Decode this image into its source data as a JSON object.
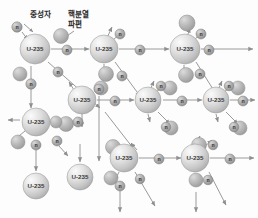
{
  "figure": {
    "background_color": "#fdfdfd",
    "width": 258,
    "height": 218
  },
  "labels": [
    {
      "id": "neutron-label",
      "text": "중성자",
      "x": 30,
      "y": 10
    },
    {
      "id": "fragment-label-1",
      "text": "핵분열",
      "x": 68,
      "y": 10
    },
    {
      "id": "fragment-label-2",
      "text": "파편",
      "x": 68,
      "y": 20
    }
  ],
  "legend_leaders": [
    {
      "id": "neutron-leader",
      "x1": 24,
      "y1": 24,
      "x2": 33,
      "y2": 32
    },
    {
      "id": "fragment-leader",
      "x1": 74,
      "y1": 31,
      "x2": 64,
      "y2": 38
    }
  ],
  "colors": {
    "nucleus_fill": "#d8d8d8",
    "nucleus_highlight": "#f4f4f4",
    "nucleus_edge": "#9a9a9a",
    "nucleus_text": "#3a3a3a",
    "neutron_fill": "#a9a9a9",
    "neutron_highlight": "#cfcfcf",
    "neutron_edge": "#7a7a7a",
    "neutron_text": "#2a2a2a",
    "fragment_fill": "#b4b4b4",
    "fragment_highlight": "#d6d6d6",
    "fragment_edge": "#8c8c8c",
    "arrow": "#8f8f8f",
    "label_text": "#2b2b2b"
  },
  "nucleus_label": "U-235",
  "neutron_label": "n",
  "nuclei": [
    {
      "id": "u1",
      "label": "U-235",
      "x": 35,
      "y": 49,
      "r": 15
    },
    {
      "id": "u2",
      "label": "U-235",
      "x": 104,
      "y": 49,
      "r": 14
    },
    {
      "id": "u3",
      "label": "U-235",
      "x": 185,
      "y": 49,
      "r": 15
    },
    {
      "id": "u4",
      "label": "U-235",
      "x": 82,
      "y": 100,
      "r": 14
    },
    {
      "id": "u5",
      "label": "U-235",
      "x": 148,
      "y": 100,
      "r": 13
    },
    {
      "id": "u6",
      "label": "U-235",
      "x": 216,
      "y": 100,
      "r": 13
    },
    {
      "id": "u7",
      "label": "U-235",
      "x": 36,
      "y": 122,
      "r": 14
    },
    {
      "id": "u8",
      "label": "U-235",
      "x": 36,
      "y": 186,
      "r": 13
    },
    {
      "id": "u9",
      "label": "U-235",
      "x": 80,
      "y": 177,
      "r": 13
    },
    {
      "id": "u10",
      "label": "U-235",
      "x": 124,
      "y": 158,
      "r": 14
    },
    {
      "id": "u11",
      "label": "U-235",
      "x": 195,
      "y": 158,
      "r": 14
    }
  ],
  "neutrons": [
    {
      "id": "n-in-1",
      "label": "n",
      "x": 17,
      "y": 27,
      "r": 5.2
    },
    {
      "id": "n-a1",
      "label": "n",
      "x": 67,
      "y": 50,
      "r": 5.0
    },
    {
      "id": "n-a2",
      "label": "n",
      "x": 140,
      "y": 50,
      "r": 5.0
    },
    {
      "id": "n-a3",
      "label": "n",
      "x": 209,
      "y": 50,
      "r": 5.0
    },
    {
      "id": "n-b1",
      "label": "n",
      "x": 31,
      "y": 84,
      "r": 5.2
    },
    {
      "id": "n-b2",
      "label": "n",
      "x": 58,
      "y": 72,
      "r": 5.0
    },
    {
      "id": "n-b3",
      "label": "n",
      "x": 120,
      "y": 34,
      "r": 5.0
    },
    {
      "id": "n-b4",
      "label": "n",
      "x": 122,
      "y": 76,
      "r": 5.0
    },
    {
      "id": "n-b5",
      "label": "n",
      "x": 201,
      "y": 34,
      "r": 5.0
    },
    {
      "id": "n-b6",
      "label": "n",
      "x": 200,
      "y": 74,
      "r": 5.0
    },
    {
      "id": "n-c1",
      "label": "n",
      "x": 115,
      "y": 101,
      "r": 5.0
    },
    {
      "id": "n-c2",
      "label": "n",
      "x": 182,
      "y": 101,
      "r": 5.0
    },
    {
      "id": "n-c3",
      "label": "n",
      "x": 243,
      "y": 101,
      "r": 5.0
    },
    {
      "id": "n-d1",
      "label": "n",
      "x": 161,
      "y": 86,
      "r": 4.8
    },
    {
      "id": "n-d2",
      "label": "n",
      "x": 229,
      "y": 86,
      "r": 4.8
    },
    {
      "id": "n-d3",
      "label": "n",
      "x": 166,
      "y": 127,
      "r": 4.8
    },
    {
      "id": "n-d4",
      "label": "n",
      "x": 234,
      "y": 127,
      "r": 4.8
    },
    {
      "id": "n-e1",
      "label": "n",
      "x": 78,
      "y": 122,
      "r": 5.0
    },
    {
      "id": "n-e2",
      "label": "n",
      "x": 57,
      "y": 141,
      "r": 5.0
    },
    {
      "id": "n-e3",
      "label": "n",
      "x": 36,
      "y": 145,
      "r": 5.0
    },
    {
      "id": "n-f1",
      "label": "n",
      "x": 159,
      "y": 159,
      "r": 5.0
    },
    {
      "id": "n-f2",
      "label": "n",
      "x": 230,
      "y": 159,
      "r": 5.0
    },
    {
      "id": "n-f3",
      "label": "n",
      "x": 213,
      "y": 145,
      "r": 4.8
    },
    {
      "id": "n-f4",
      "label": "n",
      "x": 120,
      "y": 186,
      "r": 5.0
    },
    {
      "id": "n-f5",
      "label": "n",
      "x": 140,
      "y": 179,
      "r": 4.8
    },
    {
      "id": "n-f6",
      "label": "n",
      "x": 208,
      "y": 180,
      "r": 4.8
    },
    {
      "id": "n-g1",
      "label": "n",
      "x": 99,
      "y": 89,
      "r": 5.0
    }
  ],
  "fragments": [
    {
      "id": "f-legend",
      "x": 61,
      "y": 36,
      "r": 7.5
    },
    {
      "id": "f1",
      "x": 20,
      "y": 74,
      "r": 7.0
    },
    {
      "id": "f2",
      "x": 106,
      "y": 74,
      "r": 7.5
    },
    {
      "id": "f3",
      "x": 186,
      "y": 75,
      "r": 7.5
    },
    {
      "id": "f4",
      "x": 187,
      "y": 23,
      "r": 8.0
    },
    {
      "id": "f5",
      "x": 101,
      "y": 88,
      "r": 7.0
    },
    {
      "id": "f6",
      "x": 170,
      "y": 88,
      "r": 7.0
    },
    {
      "id": "f7",
      "x": 238,
      "y": 88,
      "r": 7.0
    },
    {
      "id": "f8",
      "x": 171,
      "y": 128,
      "r": 7.0
    },
    {
      "id": "f9",
      "x": 240,
      "y": 128,
      "r": 7.0
    },
    {
      "id": "f10",
      "x": 66,
      "y": 124,
      "r": 7.5
    },
    {
      "id": "f11",
      "x": 18,
      "y": 142,
      "r": 7.0
    },
    {
      "id": "f12",
      "x": 113,
      "y": 147,
      "r": 7.5
    },
    {
      "id": "f13",
      "x": 199,
      "y": 145,
      "r": 7.5
    },
    {
      "id": "f14",
      "x": 111,
      "y": 178,
      "r": 7.0
    },
    {
      "id": "f15",
      "x": 196,
      "y": 180,
      "r": 7.0
    },
    {
      "id": "f16",
      "x": 56,
      "y": 122,
      "r": 6.0
    }
  ],
  "arrows": [
    {
      "id": "arrow-incoming-1",
      "x1": 22,
      "y1": 32,
      "x2": 28,
      "y2": 40
    },
    {
      "id": "arrow-main-1",
      "x1": 51,
      "y1": 49,
      "x2": 89,
      "y2": 49
    },
    {
      "id": "arrow-main-2",
      "x1": 119,
      "y1": 49,
      "x2": 169,
      "y2": 49
    },
    {
      "id": "arrow-main-3",
      "x1": 201,
      "y1": 49,
      "x2": 253,
      "y2": 49
    },
    {
      "id": "arrow-row2-1",
      "x1": 97,
      "y1": 100,
      "x2": 134,
      "y2": 100
    },
    {
      "id": "arrow-row2-2",
      "x1": 163,
      "y1": 100,
      "x2": 202,
      "y2": 100
    },
    {
      "id": "arrow-row2-3",
      "x1": 230,
      "y1": 100,
      "x2": 255,
      "y2": 100
    },
    {
      "id": "arrow-row3-1",
      "x1": 139,
      "y1": 158,
      "x2": 181,
      "y2": 158
    },
    {
      "id": "arrow-row3-2",
      "x1": 210,
      "y1": 158,
      "x2": 254,
      "y2": 158
    },
    {
      "id": "arrow-u1-down",
      "x1": 31,
      "y1": 66,
      "x2": 31,
      "y2": 108
    },
    {
      "id": "arrow-u1-diag",
      "x1": 48,
      "y1": 62,
      "x2": 100,
      "y2": 108
    },
    {
      "id": "arrow-u2-up",
      "x1": 106,
      "y1": 40,
      "x2": 112,
      "y2": 27
    },
    {
      "id": "arrow-u2-upr",
      "x1": 113,
      "y1": 40,
      "x2": 124,
      "y2": 30
    },
    {
      "id": "arrow-u2-down",
      "x1": 104,
      "y1": 64,
      "x2": 104,
      "y2": 73
    },
    {
      "id": "arrow-u2-diag",
      "x1": 115,
      "y1": 62,
      "x2": 140,
      "y2": 96
    },
    {
      "id": "arrow-u3-up",
      "x1": 186,
      "y1": 40,
      "x2": 190,
      "y2": 28
    },
    {
      "id": "arrow-u3-upr",
      "x1": 194,
      "y1": 40,
      "x2": 205,
      "y2": 30
    },
    {
      "id": "arrow-u3-down",
      "x1": 184,
      "y1": 65,
      "x2": 184,
      "y2": 74
    },
    {
      "id": "arrow-u3-diag",
      "x1": 196,
      "y1": 62,
      "x2": 216,
      "y2": 94
    },
    {
      "id": "arrow-u4-upl",
      "x1": 74,
      "y1": 90,
      "x2": 69,
      "y2": 82
    },
    {
      "id": "arrow-u4-down",
      "x1": 82,
      "y1": 114,
      "x2": 82,
      "y2": 127
    },
    {
      "id": "arrow-u5-up",
      "x1": 150,
      "y1": 90,
      "x2": 154,
      "y2": 81
    },
    {
      "id": "arrow-u5-upr",
      "x1": 156,
      "y1": 92,
      "x2": 165,
      "y2": 85
    },
    {
      "id": "arrow-u5-down",
      "x1": 148,
      "y1": 114,
      "x2": 150,
      "y2": 122
    },
    {
      "id": "arrow-u5-diag",
      "x1": 158,
      "y1": 112,
      "x2": 170,
      "y2": 124
    },
    {
      "id": "arrow-u6-up",
      "x1": 218,
      "y1": 90,
      "x2": 222,
      "y2": 81
    },
    {
      "id": "arrow-u6-upr",
      "x1": 224,
      "y1": 92,
      "x2": 233,
      "y2": 85
    },
    {
      "id": "arrow-u6-down",
      "x1": 216,
      "y1": 114,
      "x2": 218,
      "y2": 122
    },
    {
      "id": "arrow-u6-diag",
      "x1": 226,
      "y1": 112,
      "x2": 238,
      "y2": 124
    },
    {
      "id": "arrow-u7-left",
      "x1": 20,
      "y1": 120,
      "x2": 8,
      "y2": 120
    },
    {
      "id": "arrow-u7-dl",
      "x1": 25,
      "y1": 131,
      "x2": 14,
      "y2": 140
    },
    {
      "id": "arrow-u7-down",
      "x1": 36,
      "y1": 150,
      "x2": 36,
      "y2": 171
    },
    {
      "id": "arrow-u7-dr",
      "x1": 59,
      "y1": 146,
      "x2": 68,
      "y2": 156
    },
    {
      "id": "arrow-u7-right",
      "x1": 52,
      "y1": 122,
      "x2": 62,
      "y2": 122
    },
    {
      "id": "arrow-mid-down",
      "x1": 99,
      "y1": 96,
      "x2": 99,
      "y2": 161
    },
    {
      "id": "arrow-mid-diag",
      "x1": 105,
      "y1": 112,
      "x2": 133,
      "y2": 148
    },
    {
      "id": "arrow-u10-upl",
      "x1": 137,
      "y1": 150,
      "x2": 131,
      "y2": 143
    },
    {
      "id": "arrow-u10-dl",
      "x1": 119,
      "y1": 172,
      "x2": 115,
      "y2": 180
    },
    {
      "id": "arrow-u10-down",
      "x1": 120,
      "y1": 191,
      "x2": 120,
      "y2": 212
    },
    {
      "id": "arrow-u10-diag",
      "x1": 135,
      "y1": 172,
      "x2": 155,
      "y2": 206
    },
    {
      "id": "arrow-u11-up",
      "x1": 196,
      "y1": 145,
      "x2": 200,
      "y2": 136
    },
    {
      "id": "arrow-u11-upr",
      "x1": 203,
      "y1": 148,
      "x2": 212,
      "y2": 140
    },
    {
      "id": "arrow-u11-down",
      "x1": 196,
      "y1": 192,
      "x2": 196,
      "y2": 212
    },
    {
      "id": "arrow-u11-diag",
      "x1": 209,
      "y1": 172,
      "x2": 226,
      "y2": 205
    },
    {
      "id": "arrow-u9-in",
      "x1": 80,
      "y1": 144,
      "x2": 80,
      "y2": 162
    }
  ]
}
